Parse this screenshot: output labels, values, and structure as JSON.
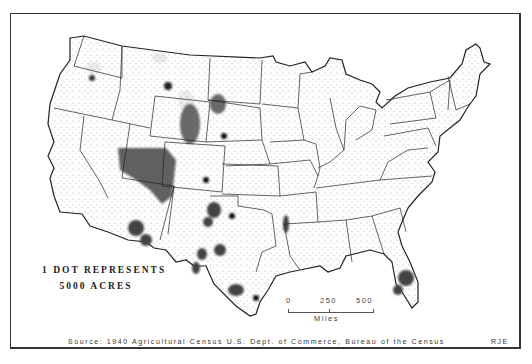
{
  "map": {
    "subject": "Dot density map of the conterminous United States",
    "legend": {
      "line1": "1 DOT REPRESENTS",
      "line2": "5000 ACRES"
    },
    "scale_bar": {
      "ticks": [
        "0",
        "250",
        "500"
      ],
      "unit": "Miles"
    },
    "source": "Source: 1940 Agricultural Census U.S. Dept. of Commerce, Bureau of the Census",
    "initials": "RJE",
    "colors": {
      "outline": "#222222",
      "dots": "#1a1a1a",
      "background": "#ffffff"
    }
  }
}
